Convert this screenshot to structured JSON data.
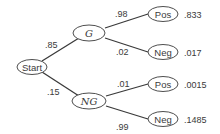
{
  "diagram": {
    "type": "probability-tree",
    "root": {
      "label": "Start"
    },
    "level1": [
      {
        "label": "G",
        "branch_prob": ".85"
      },
      {
        "label": "NG",
        "branch_prob": ".15"
      }
    ],
    "level2": [
      {
        "parent": "G",
        "label": "Pos",
        "branch_prob": ".98",
        "joint_prob": ".833"
      },
      {
        "parent": "G",
        "label": "Neg",
        "branch_prob": ".02",
        "joint_prob": ".017"
      },
      {
        "parent": "NG",
        "label": "Pos",
        "branch_prob": ".01",
        "joint_prob": ".0015"
      },
      {
        "parent": "NG",
        "label": "Neg",
        "branch_prob": ".99",
        "joint_prob": ".1485"
      }
    ],
    "colors": {
      "line": "#3a3a3a",
      "text": "#3a3a3a",
      "background": "#ffffff"
    }
  }
}
